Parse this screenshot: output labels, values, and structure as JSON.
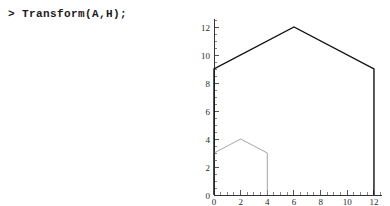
{
  "console": {
    "prompt_symbol": ">",
    "command": "> Transform(A,H);"
  },
  "chart_data": {
    "type": "line",
    "title": "",
    "xlabel": "",
    "ylabel": "",
    "xlim": [
      0,
      12.6
    ],
    "ylim": [
      0,
      12.6
    ],
    "grid": false,
    "legend": null,
    "x_ticks": [
      0,
      2,
      4,
      6,
      8,
      10,
      12
    ],
    "y_ticks": [
      0,
      2,
      4,
      6,
      8,
      10,
      12
    ],
    "x_tick_labels": [
      "0",
      "2",
      "4",
      "6",
      "8",
      "10",
      "12"
    ],
    "y_tick_labels": [
      "0",
      "2",
      "4",
      "6",
      "8",
      "10",
      "12"
    ],
    "x_minor_step": 0.5,
    "y_minor_step": 0.5,
    "series": [
      {
        "name": "A",
        "color": "#9a9a9a",
        "closed": true,
        "points": [
          [
            0,
            0
          ],
          [
            0,
            3
          ],
          [
            2,
            4
          ],
          [
            4,
            3
          ],
          [
            4,
            0
          ]
        ]
      },
      {
        "name": "Transform(A,H)",
        "color": "#111111",
        "closed": true,
        "points": [
          [
            0,
            0
          ],
          [
            0,
            9
          ],
          [
            6,
            12
          ],
          [
            12,
            9
          ],
          [
            12,
            0
          ]
        ]
      }
    ]
  }
}
